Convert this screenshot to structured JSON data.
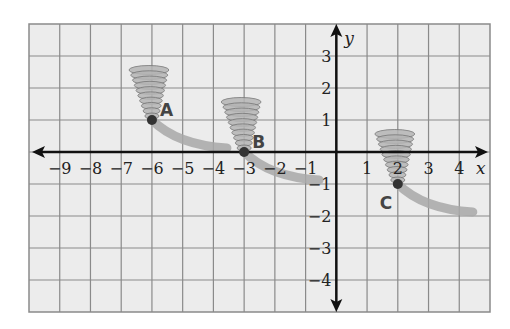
{
  "chart_data": {
    "type": "scatter",
    "title": "",
    "xlabel": "x",
    "ylabel": "y",
    "xlim": [
      -10,
      5
    ],
    "ylim": [
      -5,
      4
    ],
    "grid": true,
    "x_ticks": [
      -9,
      -8,
      -7,
      -6,
      -5,
      -4,
      -3,
      -2,
      -1,
      1,
      2,
      3,
      4
    ],
    "y_ticks": [
      3,
      2,
      1,
      -1,
      -2,
      -3,
      -4
    ],
    "points": [
      {
        "label": "A",
        "x": -6,
        "y": 1,
        "icon": "tornado-icon"
      },
      {
        "label": "B",
        "x": -3,
        "y": 0,
        "icon": "tornado-icon"
      },
      {
        "label": "C",
        "x": 2,
        "y": -1,
        "icon": "tornado-icon"
      }
    ],
    "colors": {
      "grid": "#8a8a8a",
      "background": "#ececec",
      "axis": "#111111",
      "point": "#333333",
      "trail": "#a8a8a8"
    }
  }
}
